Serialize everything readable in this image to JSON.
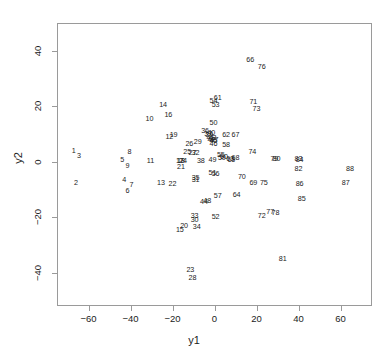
{
  "chart_data": {
    "type": "scatter",
    "title": "",
    "xlabel": "y1",
    "ylabel": "y2",
    "xlim": [
      -75,
      75
    ],
    "ylim": [
      -52,
      50
    ],
    "xticks": [
      -60,
      -40,
      -20,
      0,
      20,
      40,
      60
    ],
    "xtick_labels": [
      "−60",
      "−40",
      "−20",
      "0",
      "20",
      "40",
      "60"
    ],
    "yticks": [
      -40,
      -20,
      0,
      20,
      40
    ],
    "ytick_labels": [
      "−40",
      "−20",
      "0",
      "20",
      "40"
    ],
    "grid": false,
    "legend": null,
    "marker": "text-label",
    "point_color": "#1b1b1b",
    "frame_color": "#9a9a9a",
    "points": [
      {
        "label": "1",
        "x": -67.0,
        "y": 4.0
      },
      {
        "label": "2",
        "x": -66.0,
        "y": -7.5
      },
      {
        "label": "3",
        "x": -64.5,
        "y": 2.2
      },
      {
        "label": "4",
        "x": -43.0,
        "y": -6.5
      },
      {
        "label": "5",
        "x": -44.0,
        "y": 0.5
      },
      {
        "label": "6",
        "x": -41.5,
        "y": -10.5
      },
      {
        "label": "7",
        "x": -39.5,
        "y": -8.5
      },
      {
        "label": "8",
        "x": -40.5,
        "y": 3.5
      },
      {
        "label": "9",
        "x": -41.5,
        "y": -1.5
      },
      {
        "label": "10",
        "x": -31.0,
        "y": 15.5
      },
      {
        "label": "11",
        "x": -30.5,
        "y": 0.2
      },
      {
        "label": "12",
        "x": -21.5,
        "y": 9.0
      },
      {
        "label": "13",
        "x": -25.5,
        "y": -7.5
      },
      {
        "label": "14",
        "x": -24.5,
        "y": 20.5
      },
      {
        "label": "15",
        "x": -16.5,
        "y": -24.5
      },
      {
        "label": "16",
        "x": -22.0,
        "y": 17.0
      },
      {
        "label": "17",
        "x": -16.5,
        "y": 0.3
      },
      {
        "label": "18",
        "x": -16.0,
        "y": 0.3
      },
      {
        "label": "19",
        "x": -19.5,
        "y": 9.5
      },
      {
        "label": "20",
        "x": -14.5,
        "y": -23.0
      },
      {
        "label": "21",
        "x": -16.0,
        "y": -2.0
      },
      {
        "label": "22",
        "x": -20.0,
        "y": -8.0
      },
      {
        "label": "23",
        "x": -11.5,
        "y": -39.0
      },
      {
        "label": "24",
        "x": -15.0,
        "y": 0.2
      },
      {
        "label": "25",
        "x": -13.0,
        "y": 3.5
      },
      {
        "label": "26",
        "x": -12.0,
        "y": 6.5
      },
      {
        "label": "27",
        "x": -10.5,
        "y": 3.0
      },
      {
        "label": "28",
        "x": -10.5,
        "y": -42.0
      },
      {
        "label": "29",
        "x": -8.0,
        "y": 7.0
      },
      {
        "label": "30",
        "x": -9.5,
        "y": -21.0
      },
      {
        "label": "31",
        "x": -9.0,
        "y": -6.5
      },
      {
        "label": "32",
        "x": -9.0,
        "y": 3.0
      },
      {
        "label": "33",
        "x": -9.5,
        "y": -19.5
      },
      {
        "label": "34",
        "x": -8.5,
        "y": -23.5
      },
      {
        "label": "35",
        "x": -9.0,
        "y": -6.0
      },
      {
        "label": "36",
        "x": -4.5,
        "y": 11.0
      },
      {
        "label": "37",
        "x": -3.0,
        "y": 10.0
      },
      {
        "label": "38",
        "x": -6.5,
        "y": 0.3
      },
      {
        "label": "39",
        "x": -2.5,
        "y": 9.5
      },
      {
        "label": "40",
        "x": -1.5,
        "y": 10.5
      },
      {
        "label": "41",
        "x": -2.0,
        "y": 8.5
      },
      {
        "label": "42",
        "x": -1.5,
        "y": 8.0
      },
      {
        "label": "43",
        "x": -1.0,
        "y": 8.5
      },
      {
        "label": "44",
        "x": -5.0,
        "y": -14.5
      },
      {
        "label": "45",
        "x": -0.5,
        "y": 7.5
      },
      {
        "label": "46",
        "x": -0.5,
        "y": 6.5
      },
      {
        "label": "47",
        "x": 0.0,
        "y": 8.0
      },
      {
        "label": "48",
        "x": -3.5,
        "y": -14.0
      },
      {
        "label": "49",
        "x": -1.0,
        "y": 0.8
      },
      {
        "label": "50",
        "x": -0.5,
        "y": 14.0
      },
      {
        "label": "51",
        "x": -1.0,
        "y": -4.0
      },
      {
        "label": "52",
        "x": 0.5,
        "y": -20.0
      },
      {
        "label": "53",
        "x": 0.5,
        "y": 20.5
      },
      {
        "label": "54",
        "x": -0.5,
        "y": 22.0
      },
      {
        "label": "55",
        "x": 3.0,
        "y": 2.5
      },
      {
        "label": "56",
        "x": 0.5,
        "y": -4.5
      },
      {
        "label": "57",
        "x": 1.5,
        "y": -12.5
      },
      {
        "label": "58",
        "x": 5.5,
        "y": 6.0
      },
      {
        "label": "59",
        "x": 3.5,
        "y": 1.5
      },
      {
        "label": "60",
        "x": 4.5,
        "y": 1.8
      },
      {
        "label": "61",
        "x": 1.5,
        "y": 23.0
      },
      {
        "label": "62",
        "x": 5.5,
        "y": 9.5
      },
      {
        "label": "63",
        "x": 7.5,
        "y": 1.0
      },
      {
        "label": "64",
        "x": 10.5,
        "y": -12.0
      },
      {
        "label": "65",
        "x": 8.0,
        "y": 0.5
      },
      {
        "label": "66",
        "x": 17.0,
        "y": 36.5
      },
      {
        "label": "67",
        "x": 10.0,
        "y": 9.5
      },
      {
        "label": "68",
        "x": 10.0,
        "y": 1.5
      },
      {
        "label": "69",
        "x": 18.5,
        "y": -7.5
      },
      {
        "label": "70",
        "x": 13.0,
        "y": -5.5
      },
      {
        "label": "71",
        "x": 18.5,
        "y": 21.5
      },
      {
        "label": "72",
        "x": 22.5,
        "y": -19.5
      },
      {
        "label": "73",
        "x": 20.0,
        "y": 19.0
      },
      {
        "label": "74",
        "x": 18.0,
        "y": 3.5
      },
      {
        "label": "75",
        "x": 23.5,
        "y": -7.5
      },
      {
        "label": "76",
        "x": 22.5,
        "y": 34.0
      },
      {
        "label": "77",
        "x": 26.5,
        "y": -18.0
      },
      {
        "label": "78",
        "x": 29.0,
        "y": -18.5
      },
      {
        "label": "79",
        "x": 28.5,
        "y": 1.0
      },
      {
        "label": "80",
        "x": 29.5,
        "y": 1.0
      },
      {
        "label": "81",
        "x": 32.5,
        "y": -35.0
      },
      {
        "label": "82",
        "x": 40.0,
        "y": -2.5
      },
      {
        "label": "83",
        "x": 40.0,
        "y": 1.0
      },
      {
        "label": "84",
        "x": 40.5,
        "y": 0.5
      },
      {
        "label": "85",
        "x": 41.5,
        "y": -13.5
      },
      {
        "label": "86",
        "x": 40.5,
        "y": -8.0
      },
      {
        "label": "87",
        "x": 62.5,
        "y": -7.5
      },
      {
        "label": "88",
        "x": 64.5,
        "y": -2.5
      }
    ]
  },
  "axes": {
    "x_title": "y1",
    "y_title": "y2"
  }
}
